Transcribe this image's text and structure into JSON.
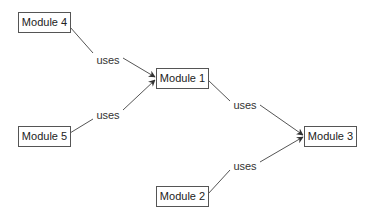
{
  "diagram": {
    "nodes": [
      {
        "id": "m4",
        "label": "Module 4",
        "x": 18,
        "y": 12,
        "w": 53,
        "h": 21
      },
      {
        "id": "m5",
        "label": "Module 5",
        "x": 18,
        "y": 126,
        "w": 53,
        "h": 21
      },
      {
        "id": "m1",
        "label": "Module 1",
        "x": 156,
        "y": 68,
        "w": 53,
        "h": 21
      },
      {
        "id": "m2",
        "label": "Module 2",
        "x": 156,
        "y": 186,
        "w": 53,
        "h": 21
      },
      {
        "id": "m3",
        "label": "Module 3",
        "x": 304,
        "y": 126,
        "w": 53,
        "h": 21
      }
    ],
    "edges": [
      {
        "from": "m4",
        "to": "m1",
        "label": "uses",
        "lx": 108,
        "ly": 60
      },
      {
        "from": "m5",
        "to": "m1",
        "label": "uses",
        "lx": 108,
        "ly": 115
      },
      {
        "from": "m1",
        "to": "m3",
        "label": "uses",
        "lx": 245,
        "ly": 105
      },
      {
        "from": "m2",
        "to": "m3",
        "label": "uses",
        "lx": 245,
        "ly": 166
      }
    ],
    "colors": {
      "line": "#555555",
      "text": "#222222",
      "background": "#ffffff"
    }
  }
}
